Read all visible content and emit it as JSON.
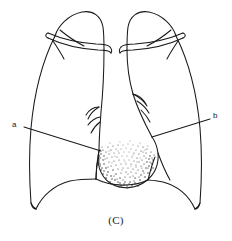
{
  "figure": {
    "caption": "(C)",
    "type": "chest-radiograph-line-diagram",
    "view": "posteroanterior",
    "background_color": "#ffffff",
    "ink_color": "#1a1a1a"
  },
  "annotations": {
    "label_a": {
      "text": "a",
      "x": 15,
      "y": 126,
      "leader_from": [
        24,
        127
      ],
      "leader_to": [
        101,
        151
      ]
    },
    "label_b": {
      "text": "b",
      "x": 216,
      "y": 117,
      "leader_from": [
        210,
        119
      ],
      "leader_to": [
        152,
        137
      ]
    }
  },
  "anatomy": {
    "left_lung_field": "left-lung-outline",
    "right_lung_field": "right-lung-outline",
    "left_clavicle": "left-clavicle",
    "right_clavicle": "right-clavicle",
    "mediastinum": "mediastinal-silhouette",
    "left_hilum": "left-hilar-vessels",
    "right_hilum": "right-hilar-vessels",
    "diaphragm": "diaphragm-domes",
    "lesion": "stippled-opacity-mass"
  },
  "stipple": {
    "dot_color": "#333333",
    "dot_count": 430,
    "region_center_x": 127,
    "region_center_y": 161,
    "region_radius_x": 34,
    "region_radius_y": 27
  }
}
